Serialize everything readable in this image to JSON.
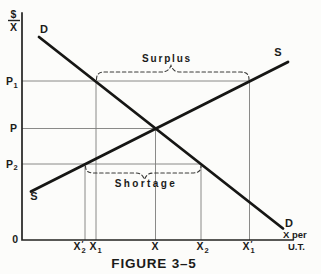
{
  "figure": {
    "caption": "FIGURE 3–5",
    "colors": {
      "ink": "#161614",
      "grid": "#7d7d7b",
      "paper": "#fcfcfa"
    },
    "y_axis": {
      "numerator": "$",
      "denominator": "X"
    },
    "x_axis": {
      "unit_line1": "X per",
      "unit_line2": "U.T."
    },
    "origin": "0",
    "curves": {
      "demand_upper": "D",
      "demand_lower": "D",
      "supply_upper": "S",
      "supply_lower": "S"
    },
    "prices": {
      "p1_base": "P",
      "p1_sub": "1",
      "p_base": "P",
      "p2_base": "P",
      "p2_sub": "2"
    },
    "quantities": {
      "x2p_base": "X",
      "x2p_prime": "′",
      "x2p_sub": "2",
      "x1_base": "X",
      "x1_sub": "1",
      "x_base": "X",
      "x2_base": "X",
      "x2_sub": "2",
      "x1p_base": "X",
      "x1p_prime": "′",
      "x1p_sub": "1"
    },
    "annotations": {
      "surplus": "Surplus",
      "shortage": "Shortage"
    }
  }
}
